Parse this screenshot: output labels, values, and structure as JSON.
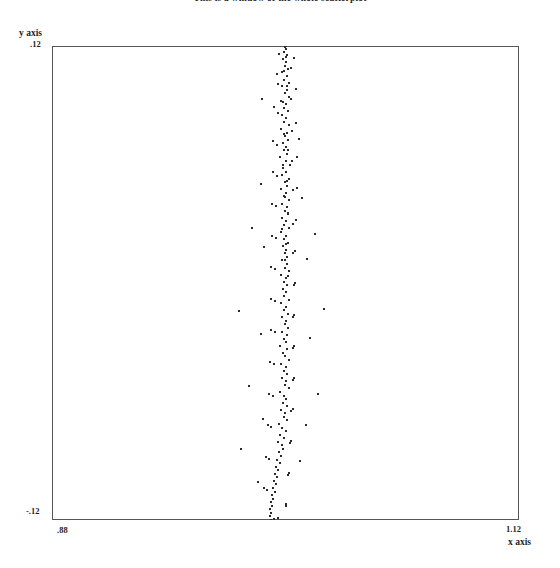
{
  "chart_data": {
    "type": "scatter",
    "title": "This is a window of the whole scatterplot",
    "xlabel": "x axis",
    "ylabel": "y axis",
    "xlim": [
      0.88,
      1.12
    ],
    "ylim": [
      -0.12,
      0.12
    ],
    "x_ticks": [
      0.88,
      1.12
    ],
    "x_tick_labels": [
      ".88",
      "1.12"
    ],
    "y_ticks": [
      -0.12,
      0.12
    ],
    "y_tick_labels": [
      "-.12",
      ".12"
    ],
    "grid": false,
    "legend": null,
    "marker": "point",
    "marker_color": "#2b2b2b",
    "frame_color": "#575757",
    "background": "#ffffff",
    "n_points": 233,
    "points": [
      [
        1.0,
        0.12
      ],
      [
        1.0005,
        0.1185
      ],
      [
        0.9992,
        0.117
      ],
      [
        1.001,
        0.1152
      ],
      [
        0.9988,
        0.1136
      ],
      [
        1.0002,
        0.1118
      ],
      [
        0.9996,
        0.11
      ],
      [
        1.0014,
        0.1084
      ],
      [
        0.9984,
        0.1066
      ],
      [
        1.0006,
        0.1048
      ],
      [
        0.9994,
        0.103
      ],
      [
        1.0018,
        0.1012
      ],
      [
        0.998,
        0.0996
      ],
      [
        1.0008,
        0.0978
      ],
      [
        0.9998,
        0.096
      ],
      [
        1.0016,
        0.0942
      ],
      [
        0.9976,
        0.0924
      ],
      [
        1.0004,
        0.0906
      ],
      [
        0.999,
        0.0888
      ],
      [
        1.0012,
        0.087
      ],
      [
        0.9982,
        0.0852
      ],
      [
        1.0,
        0.0834
      ],
      [
        0.9994,
        0.0816
      ],
      [
        1.002,
        0.0798
      ],
      [
        0.9978,
        0.078
      ],
      [
        1.0006,
        0.0762
      ],
      [
        0.9996,
        0.0744
      ],
      [
        1.0014,
        0.0726
      ],
      [
        0.9986,
        0.0708
      ],
      [
        1.0002,
        0.069
      ],
      [
        0.9992,
        0.0672
      ],
      [
        1.001,
        0.0654
      ],
      [
        0.9974,
        0.0636
      ],
      [
        1.0004,
        0.0618
      ],
      [
        1.0022,
        0.06
      ],
      [
        0.9988,
        0.0582
      ],
      [
        1.0,
        0.0564
      ],
      [
        0.9982,
        0.0546
      ],
      [
        1.0016,
        0.0528
      ],
      [
        0.9996,
        0.051
      ],
      [
        1.0008,
        0.0492
      ],
      [
        0.9978,
        0.0474
      ],
      [
        1.0002,
        0.0456
      ],
      [
        0.999,
        0.0438
      ],
      [
        1.0018,
        0.042
      ],
      [
        0.9984,
        0.0402
      ],
      [
        1.0006,
        0.0384
      ],
      [
        0.9998,
        0.0366
      ],
      [
        1.0012,
        0.0348
      ],
      [
        0.998,
        0.033
      ],
      [
        1.0,
        0.0312
      ],
      [
        0.9994,
        0.0294
      ],
      [
        1.002,
        0.0276
      ],
      [
        0.9976,
        0.0258
      ],
      [
        1.0004,
        0.024
      ],
      [
        0.9992,
        0.0222
      ],
      [
        1.0014,
        0.0204
      ],
      [
        0.9986,
        0.0186
      ],
      [
        1.0002,
        0.0168
      ],
      [
        0.9996,
        0.015
      ],
      [
        1.001,
        0.0132
      ],
      [
        0.9982,
        0.0114
      ],
      [
        1.0006,
        0.0096
      ],
      [
        0.9998,
        0.0078
      ],
      [
        1.0016,
        0.006
      ],
      [
        0.9978,
        0.0042
      ],
      [
        1.0,
        0.0024
      ],
      [
        0.999,
        0.0006
      ],
      [
        1.0008,
        -0.0012
      ],
      [
        0.9986,
        -0.003
      ],
      [
        1.0002,
        -0.0048
      ],
      [
        0.9994,
        -0.0066
      ],
      [
        1.0018,
        -0.0084
      ],
      [
        0.9976,
        -0.0102
      ],
      [
        1.0004,
        -0.012
      ],
      [
        0.9992,
        -0.0138
      ],
      [
        1.0012,
        -0.0156
      ],
      [
        0.9984,
        -0.0174
      ],
      [
        1.0,
        -0.0192
      ],
      [
        0.9996,
        -0.021
      ],
      [
        1.0014,
        -0.0228
      ],
      [
        0.998,
        -0.0246
      ],
      [
        1.0006,
        -0.0264
      ],
      [
        0.999,
        -0.0282
      ],
      [
        1.0002,
        -0.03
      ],
      [
        0.9974,
        -0.0318
      ],
      [
        1.001,
        -0.0336
      ],
      [
        0.9988,
        -0.0354
      ],
      [
        0.9998,
        -0.0372
      ],
      [
        1.002,
        -0.039
      ],
      [
        0.9978,
        -0.0408
      ],
      [
        1.0,
        -0.0426
      ],
      [
        0.9994,
        -0.0444
      ],
      [
        1.0008,
        -0.0462
      ],
      [
        0.9982,
        -0.048
      ],
      [
        1.0004,
        -0.0498
      ],
      [
        0.9996,
        -0.0516
      ],
      [
        1.0016,
        -0.0534
      ],
      [
        0.9972,
        -0.0552
      ],
      [
        0.999,
        -0.057
      ],
      [
        1.0002,
        -0.0588
      ],
      [
        0.9986,
        -0.0606
      ],
      [
        1.001,
        -0.0624
      ],
      [
        0.9978,
        -0.0642
      ],
      [
        0.9998,
        -0.066
      ],
      [
        0.9992,
        -0.0678
      ],
      [
        1.0006,
        -0.0696
      ],
      [
        0.9968,
        -0.0714
      ],
      [
        0.9984,
        -0.0732
      ],
      [
        1.0,
        -0.075
      ],
      [
        0.9974,
        -0.0768
      ],
      [
        0.9994,
        -0.0786
      ],
      [
        0.9962,
        -0.0804
      ],
      [
        0.998,
        -0.0822
      ],
      [
        0.9988,
        -0.084
      ],
      [
        0.9966,
        -0.0858
      ],
      [
        0.9976,
        -0.0876
      ],
      [
        0.9958,
        -0.0894
      ],
      [
        0.997,
        -0.0912
      ],
      [
        0.9952,
        -0.093
      ],
      [
        0.9964,
        -0.0948
      ],
      [
        0.9946,
        -0.0966
      ],
      [
        0.9956,
        -0.0984
      ],
      [
        0.994,
        -0.1002
      ],
      [
        0.995,
        -0.102
      ],
      [
        0.9934,
        -0.1038
      ],
      [
        0.9944,
        -0.1056
      ],
      [
        0.993,
        -0.1074
      ],
      [
        0.9938,
        -0.1092
      ],
      [
        0.9926,
        -0.111
      ],
      [
        0.9932,
        -0.1128
      ],
      [
        0.9922,
        -0.1146
      ],
      [
        0.9928,
        -0.1164
      ],
      [
        0.9918,
        -0.1182
      ],
      [
        0.9924,
        -0.12
      ],
      [
        0.9968,
        0.116
      ],
      [
        1.0026,
        0.109
      ],
      [
        0.9964,
        0.101
      ],
      [
        1.003,
        0.093
      ],
      [
        0.996,
        0.086
      ],
      [
        1.0032,
        0.077
      ],
      [
        0.9958,
        0.07
      ],
      [
        1.0034,
        0.062
      ],
      [
        0.9954,
        0.054
      ],
      [
        1.0036,
        0.047
      ],
      [
        0.9952,
        0.039
      ],
      [
        1.0038,
        0.03
      ],
      [
        0.995,
        0.023
      ],
      [
        1.004,
        0.015
      ],
      [
        0.9948,
        0.007
      ],
      [
        1.0042,
        -0.001
      ],
      [
        0.9946,
        -0.009
      ],
      [
        1.004,
        -0.017
      ],
      [
        0.9944,
        -0.025
      ],
      [
        1.0038,
        -0.033
      ],
      [
        0.9942,
        -0.041
      ],
      [
        1.0036,
        -0.049
      ],
      [
        0.9936,
        -0.057
      ],
      [
        1.003,
        -0.065
      ],
      [
        0.9928,
        -0.073
      ],
      [
        1.0024,
        -0.081
      ],
      [
        0.9916,
        -0.089
      ],
      [
        1.0014,
        -0.097
      ],
      [
        0.9906,
        -0.105
      ],
      [
        1.0,
        -0.113
      ],
      [
        0.988,
        0.093
      ],
      [
        1.0068,
        0.073
      ],
      [
        0.9872,
        0.05
      ],
      [
        1.0086,
        0.043
      ],
      [
        0.983,
        0.028
      ],
      [
        1.015,
        0.025
      ],
      [
        0.989,
        0.018
      ],
      [
        1.0108,
        0.012
      ],
      [
        0.976,
        -0.014
      ],
      [
        1.0198,
        -0.013
      ],
      [
        0.9872,
        -0.026
      ],
      [
        1.0126,
        -0.028
      ],
      [
        0.981,
        -0.052
      ],
      [
        1.0166,
        -0.056
      ],
      [
        0.9884,
        -0.069
      ],
      [
        1.0104,
        -0.072
      ],
      [
        0.9772,
        -0.084
      ],
      [
        1.0072,
        -0.09
      ],
      [
        0.986,
        -0.101
      ],
      [
        0.996,
        -0.119
      ],
      [
        1.0046,
        0.114
      ],
      [
        0.9954,
        0.106
      ],
      [
        1.0052,
        0.098
      ],
      [
        0.9942,
        0.089
      ],
      [
        1.0056,
        0.081
      ],
      [
        0.9938,
        0.072
      ],
      [
        1.006,
        0.064
      ],
      [
        0.9934,
        0.056
      ],
      [
        1.0058,
        0.048
      ],
      [
        0.9932,
        0.04
      ],
      [
        1.0054,
        0.032
      ],
      [
        0.993,
        0.024
      ],
      [
        1.005,
        0.016
      ],
      [
        0.9928,
        0.008
      ],
      [
        1.0048,
        0.0
      ],
      [
        0.9926,
        -0.008
      ],
      [
        1.0046,
        -0.016
      ],
      [
        0.9924,
        -0.024
      ],
      [
        1.0044,
        -0.032
      ],
      [
        0.992,
        -0.04
      ],
      [
        1.0042,
        -0.048
      ],
      [
        0.9916,
        -0.056
      ],
      [
        1.0038,
        -0.064
      ],
      [
        0.991,
        -0.072
      ],
      [
        1.003,
        -0.08
      ],
      [
        0.99,
        -0.088
      ],
      [
        1.0018,
        -0.096
      ],
      [
        0.989,
        -0.104
      ],
      [
        1.0004,
        -0.112
      ],
      [
        0.994,
        -0.1195
      ],
      [
        0.9998,
        0.1195
      ],
      [
        1.0003,
        0.1145
      ],
      [
        0.9991,
        0.1075
      ],
      [
        1.0009,
        0.0995
      ],
      [
        0.9987,
        0.0915
      ],
      [
        1.0005,
        0.0835
      ],
      [
        0.9993,
        0.0755
      ],
      [
        1.0011,
        0.0675
      ],
      [
        0.9985,
        0.0595
      ],
      [
        1.0007,
        0.0515
      ],
      [
        0.9995,
        0.0435
      ],
      [
        1.0013,
        0.0355
      ],
      [
        0.9983,
        0.0275
      ],
      [
        1.0001,
        0.0195
      ],
      [
        0.9997,
        0.0115
      ],
      [
        1.0015,
        0.0035
      ]
    ]
  }
}
